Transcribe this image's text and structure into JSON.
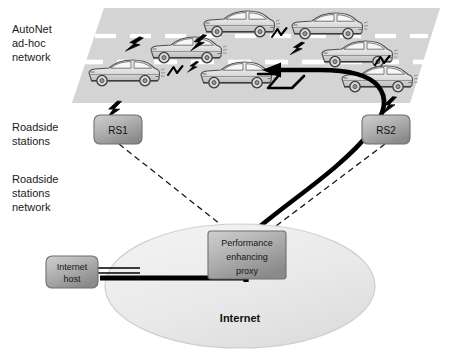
{
  "diagram": {
    "labels": {
      "autonet": "AutoNet\nad-hoc\nnetwork",
      "roadside_stations": "Roadside\nstations",
      "roadside_stations_network": "Roadside\nstations\nnetwork"
    },
    "nodes": {
      "rs1": "RS1",
      "rs2": "RS2",
      "proxy_line1": "Performance",
      "proxy_line2": "enhancing",
      "proxy_line3": "proxy",
      "internet_host_line1": "Internet",
      "internet_host_line2": "host",
      "internet_cloud": "Internet"
    },
    "colors": {
      "road_fill": "#d6d6d6",
      "lane_marking": "#ffffff",
      "box_fill_light": "#c8c8c8",
      "box_fill_dark": "#8e8e8e",
      "box_stroke": "#6d6d6d",
      "cloud_fill": "#ededed",
      "cloud_stroke": "#c9c9c9",
      "car_body": "#e3e3e3",
      "car_outline": "#4a4a4a",
      "link_black": "#000000",
      "dashed_link": "#1a1a1a",
      "text": "#111111",
      "background": "#ffffff"
    },
    "cars": [
      {
        "id": "car-lane1-a",
        "lane": 1,
        "x": 200,
        "y": 12
      },
      {
        "id": "car-lane1-b",
        "lane": 1,
        "x": 288,
        "y": 14
      },
      {
        "id": "car-lane2-a",
        "lane": 2,
        "x": 147,
        "y": 38
      },
      {
        "id": "car-lane2-b",
        "lane": 2,
        "x": 318,
        "y": 42
      },
      {
        "id": "car-lane3-a",
        "lane": 3,
        "x": 85,
        "y": 60
      },
      {
        "id": "car-lane3-b",
        "lane": 3,
        "x": 197,
        "y": 62
      },
      {
        "id": "car-lane3-c",
        "lane": 3,
        "x": 338,
        "y": 66
      }
    ],
    "wireless_links": [
      {
        "id": "bolt-car-a",
        "from": "car-lane2-a",
        "to": "car-lane1-a"
      },
      {
        "id": "bolt-car-b",
        "from": "car-lane1-a",
        "to": "car-lane1-b"
      },
      {
        "id": "bolt-car-c",
        "from": "car-lane1-b",
        "to": "car-lane2-b"
      },
      {
        "id": "bolt-car-d",
        "from": "car-lane3-a",
        "to": "car-lane3-b"
      },
      {
        "id": "bolt-car-e",
        "from": "car-lane1-a",
        "to": "car-lane3-b"
      },
      {
        "id": "bolt-car-f",
        "from": "car-lane2-b",
        "to": "car-lane3-c"
      },
      {
        "id": "bolt-rs1",
        "from": "car-lane3-a",
        "to": "rs1"
      },
      {
        "id": "bolt-rs2",
        "from": "car-lane3-c",
        "to": "rs2"
      }
    ],
    "connections": [
      {
        "id": "rs1-to-proxy",
        "style": "dashed",
        "from": "rs1",
        "to": "proxy"
      },
      {
        "id": "rs2-to-proxy",
        "style": "dashed",
        "from": "rs2",
        "to": "proxy"
      },
      {
        "id": "proxy-to-vehicle",
        "style": "thick-arrow",
        "from": "proxy",
        "to": "car-lane3-b"
      },
      {
        "id": "host-to-proxy",
        "style": "thick-arrow",
        "from": "internet-host",
        "to": "proxy"
      },
      {
        "id": "host-to-cloud",
        "style": "double-line",
        "from": "internet-host",
        "to": "internet-cloud"
      }
    ]
  }
}
